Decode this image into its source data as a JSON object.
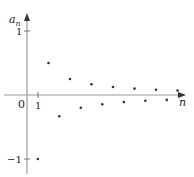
{
  "chart_data": {
    "type": "scatter",
    "title": "",
    "xlabel": "n",
    "ylabel": "a_n",
    "ylabel_base": "a",
    "ylabel_sub": "n",
    "origin_label": "0",
    "x_tick_labels": [
      "1"
    ],
    "y_tick_labels": [
      "1",
      "−1"
    ],
    "x": [
      1,
      2,
      3,
      4,
      5,
      6,
      7,
      8,
      9,
      10,
      11,
      12,
      13,
      14
    ],
    "values": [
      -1,
      0.5,
      -0.333,
      0.25,
      -0.2,
      0.167,
      -0.143,
      0.125,
      -0.111,
      0.1,
      -0.091,
      0.083,
      -0.077,
      0.071
    ],
    "formula": "a_n = (-1)^n / n",
    "ylim": [
      -1.2,
      1.25
    ],
    "xlim": [
      0,
      15
    ],
    "grid": false,
    "legend": null
  },
  "colors": {
    "axis": "#9a9a9a",
    "points": "#333333",
    "text": "#222222"
  }
}
